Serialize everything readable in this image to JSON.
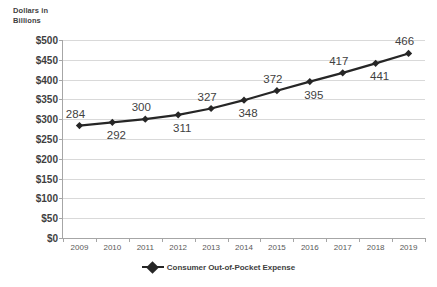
{
  "chart_data": {
    "type": "line",
    "title": "",
    "axis_note": "Dollars in Billions",
    "categories": [
      "2009",
      "2010",
      "2011",
      "2012",
      "2013",
      "2014",
      "2015",
      "2016",
      "2017",
      "2018",
      "2019"
    ],
    "series": [
      {
        "name": "Consumer Out-of-Pocket Expense",
        "values": [
          284,
          292,
          300,
          311,
          327,
          348,
          372,
          395,
          417,
          441,
          466
        ],
        "color": "#262626",
        "marker": "diamond"
      }
    ],
    "data_label_positions": [
      "above",
      "below",
      "above",
      "below",
      "above",
      "below",
      "above",
      "below",
      "above",
      "below",
      "above"
    ],
    "xlabel": "",
    "ylabel": "Dollars in Billions",
    "ylim": [
      0,
      500
    ],
    "ytick_values": [
      0,
      50,
      100,
      150,
      200,
      250,
      300,
      350,
      400,
      450,
      500
    ],
    "ytick_labels": [
      "$0",
      "$50",
      "$100",
      "$150",
      "$200",
      "$250",
      "$300",
      "$350",
      "$400",
      "$450",
      "$500"
    ],
    "grid": "horizontal",
    "grid_color": "#d9d9d9",
    "legend_position": "bottom-center",
    "legend_entries": [
      "Consumer Out-of-Pocket Expense"
    ],
    "background": "#ffffff"
  }
}
